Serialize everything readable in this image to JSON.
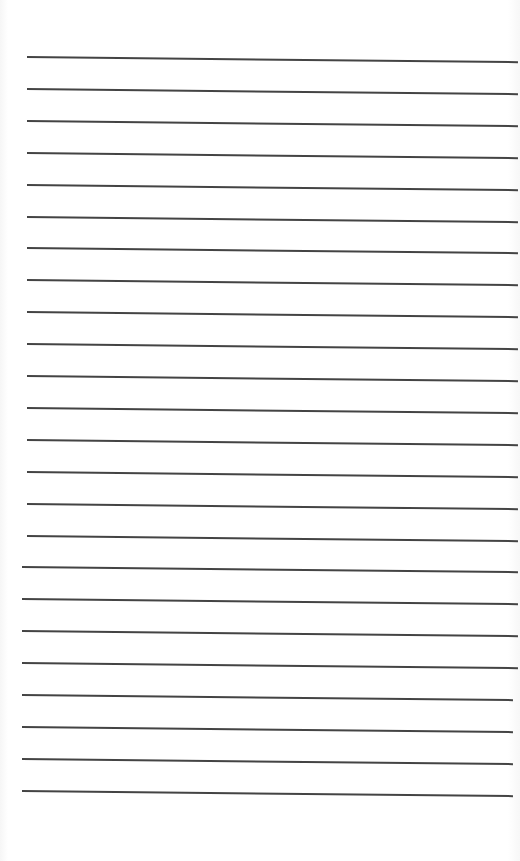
{
  "page": {
    "type": "lined-paper",
    "background_color": "#ffffff",
    "line_color": "#444444",
    "line_count": 24,
    "first_line_y": 56,
    "line_spacing": 31.9,
    "line_left_x": 27,
    "line_right_x": 518
  }
}
